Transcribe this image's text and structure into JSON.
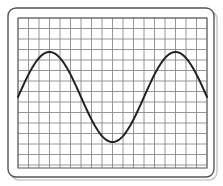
{
  "figure": {
    "title": "Sine wave plotted on graph paper",
    "background_color": "#ffffff",
    "panel": {
      "label": "graph-paper-panel",
      "x": 8,
      "y": 8,
      "width": 206,
      "height": 169,
      "corner_radius": 8,
      "border_color": "#555555",
      "border_width": 1.4,
      "fill_color": "#ffffff",
      "shadow_color": "#b8b8b8"
    },
    "grid": {
      "label": "graph-paper-grid",
      "x": 18,
      "y": 18,
      "width": 189,
      "height": 150,
      "cell_size": 10.5,
      "columns": 18,
      "rows": 14,
      "line_color": "#8a8a8a",
      "line_width": 0.9,
      "border_color": "#6e6e6e",
      "border_width": 1.2,
      "visible": true
    },
    "curve": {
      "label": "sine-curve",
      "color": "#232323",
      "width": 2.0,
      "linecap": "round",
      "linejoin": "round"
    }
  },
  "chart_data": {
    "type": "line",
    "title": "Sine wave plotted on graph paper",
    "subtitle": "",
    "xlabel": "",
    "ylabel": "",
    "grid": true,
    "legend": false,
    "legend_position": "none",
    "xticklabels": [],
    "yticklabels": [],
    "xlim": [
      0,
      1.5
    ],
    "ylim": [
      -1,
      1
    ],
    "function": "y = sin(2*pi*x)",
    "amplitude": 1,
    "periods": 1.5,
    "phase": 0,
    "midline_y_px": 97,
    "peak_y_px": 52,
    "trough_y_px": 137,
    "features": [
      {
        "name": "left-endpoint",
        "x_px": 18,
        "y_px": 97,
        "x": 0.0,
        "y": 0
      },
      {
        "name": "first-peak",
        "x_px": 53,
        "y_px": 52,
        "x": 0.25,
        "y": 1
      },
      {
        "name": "first-midline-cross",
        "x_px": 85,
        "y_px": 97,
        "x": 0.5,
        "y": 0
      },
      {
        "name": "trough",
        "x_px": 113,
        "y_px": 137,
        "x": 0.75,
        "y": -1
      },
      {
        "name": "second-midline-cross",
        "x_px": 145,
        "y_px": 97,
        "x": 1.0,
        "y": 0
      },
      {
        "name": "second-peak",
        "x_px": 180,
        "y_px": 53,
        "x": 1.25,
        "y": 1
      },
      {
        "name": "right-endpoint",
        "x_px": 207,
        "y_px": 97,
        "x": 1.5,
        "y": 0
      }
    ],
    "x": [
      0,
      0.0625,
      0.125,
      0.1875,
      0.25,
      0.3125,
      0.375,
      0.4375,
      0.5,
      0.5625,
      0.625,
      0.6875,
      0.75,
      0.8125,
      0.875,
      0.9375,
      1.0,
      1.0625,
      1.125,
      1.1875,
      1.25,
      1.3125,
      1.375,
      1.4375,
      1.5
    ],
    "values": [
      0,
      0.383,
      0.707,
      0.924,
      1,
      0.924,
      0.707,
      0.383,
      0,
      -0.383,
      -0.707,
      -0.924,
      -1,
      -0.924,
      -0.707,
      -0.383,
      0,
      0.383,
      0.707,
      0.924,
      1,
      0.924,
      0.707,
      0.383,
      0
    ]
  }
}
